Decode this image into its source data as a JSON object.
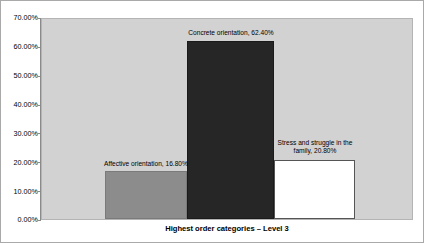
{
  "chart_data": {
    "type": "bar",
    "title": "",
    "xlabel": "Highest order categories – Level 3",
    "ylabel": "",
    "ylim": [
      0,
      70
    ],
    "grid": false,
    "legend": "none",
    "y_tick_labels": [
      "70.00%",
      "60.00%",
      "50.00%",
      "40.00%",
      "30.00%",
      "20.00%",
      "10.00%",
      "0.00%"
    ],
    "y_tick_values": [
      70,
      60,
      50,
      40,
      30,
      20,
      10,
      0
    ],
    "categories": [
      "Affective orientation",
      "Concrete orientation",
      "Stress and struggle in the family"
    ],
    "values": [
      16.8,
      20.8,
      62.4
    ],
    "series": [
      {
        "name": "Highest order categories – Level 3",
        "points": [
          {
            "category": "Affective orientation",
            "value": 16.8,
            "data_label": "Affective orientation, 16.80%",
            "color": "#8c8c8c"
          },
          {
            "category": "Concrete orientation",
            "value": 62.4,
            "data_label": "Concrete orientation, 62.40%",
            "color": "#262626"
          },
          {
            "category": "Stress and struggle in the family",
            "value": 20.8,
            "data_label": "Stress and struggle in the family, 20.80%",
            "color": "#ffffff"
          }
        ]
      }
    ],
    "annotations": [
      "Affective orientation, 16.80%",
      "Concrete orientation, 62.40%",
      "Stress and struggle in the family, 20.80%"
    ]
  },
  "axis": {
    "y_ticks": [
      {
        "label": "70.00%",
        "value": 70
      },
      {
        "label": "60.00%",
        "value": 60
      },
      {
        "label": "50.00%",
        "value": 50
      },
      {
        "label": "40.00%",
        "value": 40
      },
      {
        "label": "30.00%",
        "value": 30
      },
      {
        "label": "20.00%",
        "value": 20
      },
      {
        "label": "10.00%",
        "value": 10
      },
      {
        "label": "0.00%",
        "value": 0
      }
    ],
    "x_title": "Highest order categories – Level 3"
  },
  "labels": {
    "affective_line1": "Affective orientation, 16.80%",
    "concrete_line1": "Concrete orientation, 62.40%",
    "stress_line1": "Stress and struggle in the",
    "stress_line2": "family, 20.80%"
  },
  "colors": {
    "plot_background": "#d2d2d2",
    "canvas_background": "#ffffff",
    "bar_affective": "#8c8c8c",
    "bar_concrete": "#262626",
    "bar_stress": "#ffffff",
    "axis_line": "#8a8a8a",
    "frame_border": "#a9a9a9",
    "text": "#000000"
  }
}
